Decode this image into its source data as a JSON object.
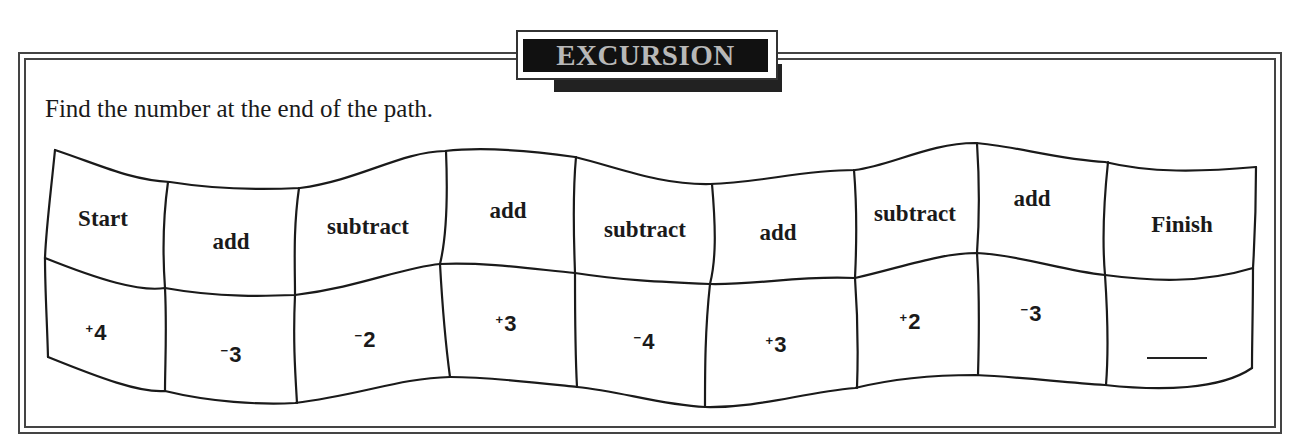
{
  "banner": {
    "title": "EXCURSION"
  },
  "instruction": "Find the number at the end of the path.",
  "path": {
    "labels": [
      "Start",
      "add",
      "subtract",
      "add",
      "subtract",
      "add",
      "subtract",
      "add",
      "Finish"
    ],
    "values": [
      {
        "sign": "+",
        "number": "4"
      },
      {
        "sign": "−",
        "number": "3"
      },
      {
        "sign": "−",
        "number": "2"
      },
      {
        "sign": "+",
        "number": "3"
      },
      {
        "sign": "−",
        "number": "4"
      },
      {
        "sign": "+",
        "number": "3"
      },
      {
        "sign": "+",
        "number": "2"
      },
      {
        "sign": "−",
        "number": "3"
      },
      {
        "sign": "",
        "number": ""
      }
    ],
    "answer_blank": ""
  }
}
